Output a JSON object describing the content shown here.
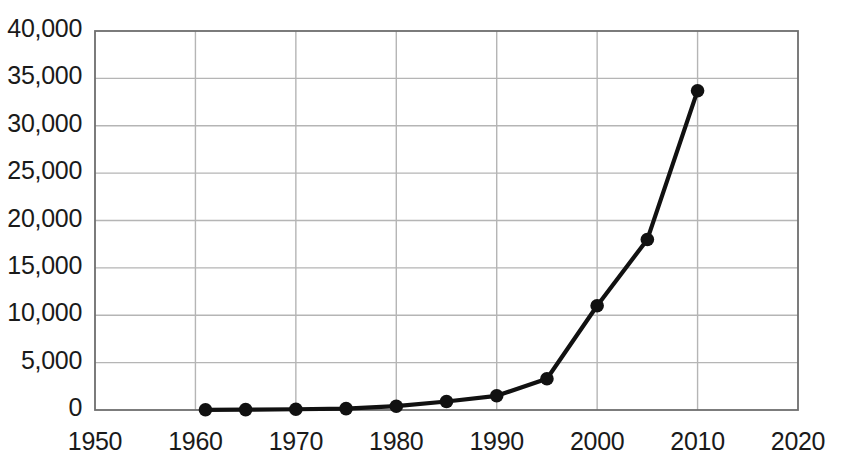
{
  "chart_data": {
    "type": "line",
    "title": "",
    "subtitle": "",
    "xlabel": "",
    "ylabel": "",
    "xlim": [
      1950,
      2020
    ],
    "ylim": [
      0,
      40000
    ],
    "grid": true,
    "legend": null,
    "x_ticks": [
      "1950",
      "1960",
      "1970",
      "1980",
      "1990",
      "2000",
      "2010",
      "2020"
    ],
    "x_tick_values": [
      1950,
      1960,
      1970,
      1980,
      1990,
      2000,
      2010,
      2020
    ],
    "y_ticks": [
      "0",
      "5,000",
      "10,000",
      "15,000",
      "20,000",
      "25,000",
      "30,000",
      "35,000",
      "40,000"
    ],
    "y_tick_values": [
      0,
      5000,
      10000,
      15000,
      20000,
      25000,
      30000,
      35000,
      40000
    ],
    "series": [
      {
        "name": "series-1",
        "color": "#111111",
        "marker": "circle",
        "x": [
          1961,
          1965,
          1970,
          1975,
          1980,
          1985,
          1990,
          1995,
          2000,
          2005,
          2010
        ],
        "values": [
          20,
          40,
          80,
          150,
          400,
          900,
          1500,
          3300,
          11000,
          18000,
          33700
        ]
      }
    ]
  },
  "style": {
    "background": "#ffffff",
    "grid_color": "#b5b5b5",
    "axis_color": "#6e6e6e",
    "line_color": "#111111",
    "marker_color": "#111111",
    "text_color": "#1a1a1a"
  }
}
